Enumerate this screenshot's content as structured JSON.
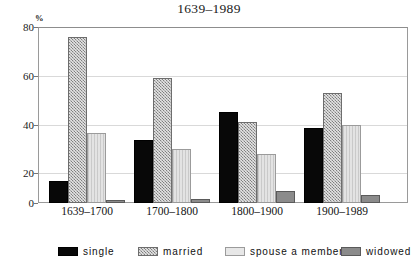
{
  "chart_data": {
    "type": "bar",
    "title": "1639–1989",
    "xlabel": "",
    "ylabel": "%",
    "ylim": [
      0,
      80
    ],
    "yticks": [
      0,
      20,
      40,
      60,
      80
    ],
    "grid": true,
    "legend_position": "bottom",
    "categories": [
      "1639–1700",
      "1700–1800",
      "1800–1900",
      "1900–1989"
    ],
    "series": [
      {
        "name": "single",
        "color": "#080808",
        "values": [
          10,
          28.5,
          41.5,
          34
        ]
      },
      {
        "name": "married",
        "color": "#b0b0b0",
        "values": [
          75.5,
          57,
          37,
          50
        ]
      },
      {
        "name": "spouse a member",
        "color": "#e3e3e3",
        "values": [
          32,
          24.5,
          22.5,
          35.5
        ]
      },
      {
        "name": "widowed",
        "color": "#8b8b8b",
        "values": [
          1.5,
          2,
          5.5,
          3.5
        ]
      }
    ]
  },
  "axis": {
    "unit_label": "%",
    "y_tick_labels": [
      "80",
      "60",
      "40",
      "20",
      "0"
    ]
  },
  "legend": {
    "items": [
      {
        "label": "single"
      },
      {
        "label": "married"
      },
      {
        "label": "spouse a member"
      },
      {
        "label": "widowed"
      }
    ]
  }
}
